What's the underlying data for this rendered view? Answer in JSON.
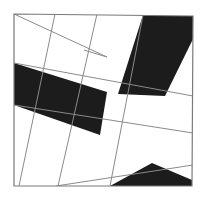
{
  "figure": {
    "canvas": {
      "width": 206,
      "height": 199
    },
    "colors": {
      "background": "#ffffff",
      "fill_light": "#ffffff",
      "fill_dark": "#1c1c1c",
      "line": "#8a8a8a",
      "frame": "#7a7a7a"
    },
    "frame": {
      "name": "outer-square-frame",
      "corners": {
        "top_left": [
          14,
          14
        ],
        "top_right": [
          193,
          16
        ],
        "bottom_right": [
          192,
          186
        ],
        "bottom_left": [
          14,
          186
        ]
      },
      "stroke_width": 1.2
    },
    "dark_shapes": [
      {
        "name": "dark-band-top-right",
        "points": "143,15 193,16 193,39 165,96 118,94"
      },
      {
        "name": "dark-band-left-middle",
        "points": "14,63 14,105 100,135 107,92"
      },
      {
        "name": "dark-wedge-bottom-right",
        "points": "110,186 192,186 192,180 152,163"
      }
    ],
    "grid_lines": [
      {
        "name": "grid-line-a1",
        "x1": 14,
        "y1": 14,
        "x2": 107,
        "y2": 57
      },
      {
        "name": "grid-line-a2",
        "x1": 14,
        "y1": 105,
        "x2": 193,
        "y2": 133
      },
      {
        "name": "grid-line-a3",
        "x1": 14,
        "y1": 63,
        "x2": 193,
        "y2": 96
      },
      {
        "name": "grid-line-a4",
        "x1": 56,
        "y1": 186,
        "x2": 193,
        "y2": 165
      },
      {
        "name": "grid-line-b1",
        "x1": 97,
        "y1": 14,
        "x2": 58,
        "y2": 186
      },
      {
        "name": "grid-line-b2",
        "x1": 143,
        "y1": 15,
        "x2": 110,
        "y2": 186
      },
      {
        "name": "grid-line-b3",
        "x1": 55,
        "y1": 14,
        "x2": 19,
        "y2": 186
      },
      {
        "name": "grid-line-b4",
        "x1": 84,
        "y1": 50,
        "x2": 107,
        "y2": 57
      }
    ]
  }
}
